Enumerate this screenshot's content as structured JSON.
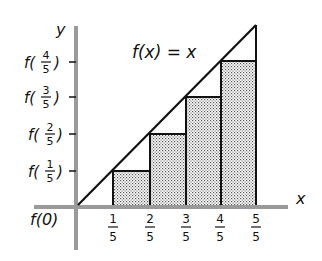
{
  "diagram": {
    "curve_label": "f(x) = x",
    "axes": {
      "x_label": "x",
      "y_label": "y",
      "color": "#9a9a9a"
    },
    "x_ticks": [
      {
        "num": "1",
        "den": "5"
      },
      {
        "num": "2",
        "den": "5"
      },
      {
        "num": "3",
        "den": "5"
      },
      {
        "num": "4",
        "den": "5"
      },
      {
        "num": "5",
        "den": "5"
      }
    ],
    "y_ticks": [
      {
        "fn": "f(",
        "num": "1",
        "den": "5",
        "close": ")"
      },
      {
        "fn": "f(",
        "num": "2",
        "den": "5",
        "close": ")"
      },
      {
        "fn": "f(",
        "num": "3",
        "den": "5",
        "close": ")"
      },
      {
        "fn": "f(",
        "num": "4",
        "den": "5",
        "close": ")"
      }
    ],
    "origin_label": "f(0)",
    "rectangles": [
      {
        "x_from": "1/5",
        "x_to": "2/5",
        "height": "f(1/5)"
      },
      {
        "x_from": "2/5",
        "x_to": "3/5",
        "height": "f(2/5)"
      },
      {
        "x_from": "3/5",
        "x_to": "4/5",
        "height": "f(3/5)"
      },
      {
        "x_from": "4/5",
        "x_to": "5/5",
        "height": "f(4/5)"
      }
    ],
    "fill_pattern": "stipple",
    "line_color": "#111111"
  }
}
